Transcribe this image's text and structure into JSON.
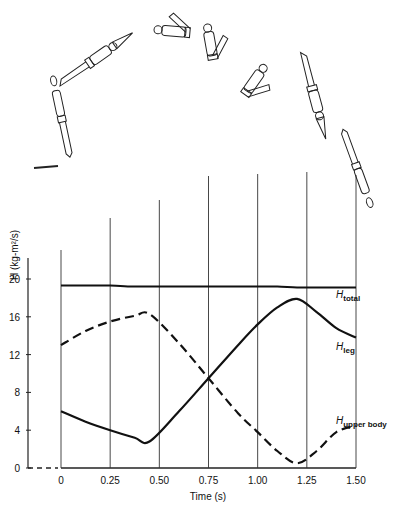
{
  "chart_data": {
    "type": "line",
    "title": "",
    "xlabel": "Time (s)",
    "ylabel": "H (kg-m²/s)",
    "xlim": [
      0,
      1.5
    ],
    "ylim": [
      0,
      22
    ],
    "x_ticks": [
      "0",
      "0.25",
      "0.50",
      "0.75",
      "1.00",
      "1.25",
      "1.50"
    ],
    "y_ticks": [
      "0",
      "4",
      "8",
      "12",
      "16",
      "20"
    ],
    "grid": "vertical lines at each x tick",
    "legend": "inline labels at right end of curves",
    "x": [
      0,
      0.125,
      0.25,
      0.375,
      0.45,
      0.6,
      0.75,
      0.9,
      1.0,
      1.1,
      1.2,
      1.3,
      1.4,
      1.5
    ],
    "series": [
      {
        "name": "H_total",
        "label_main": "H",
        "label_sub": "total",
        "style": "solid",
        "values": [
          19.3,
          19.3,
          19.3,
          19.2,
          19.2,
          19.2,
          19.2,
          19.2,
          19.2,
          19.2,
          19.1,
          19.1,
          19.1,
          19.1
        ]
      },
      {
        "name": "H_leg",
        "label_main": "H",
        "label_sub": "leg",
        "style": "solid",
        "values": [
          6.0,
          4.9,
          4.0,
          3.2,
          2.8,
          6.0,
          9.5,
          13.0,
          15.2,
          17.0,
          17.9,
          16.5,
          14.8,
          13.8
        ]
      },
      {
        "name": "H_upper body",
        "label_main": "H",
        "label_sub": "upper body",
        "style": "dashed",
        "values": [
          13.0,
          14.5,
          15.5,
          16.1,
          16.3,
          13.2,
          9.5,
          5.8,
          3.8,
          1.8,
          0.5,
          1.8,
          3.8,
          4.5
        ]
      }
    ],
    "annotations": [
      "Sequence of diver figures above the plot performing a forward pike dive, one figure aligned to each time gridline"
    ]
  },
  "axes": {
    "xlabel": "Time (s)",
    "ylabel_main": "H",
    "ylabel_unit": "(kg-m²/s)"
  }
}
